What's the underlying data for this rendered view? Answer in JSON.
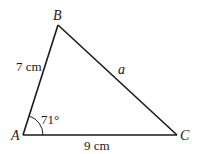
{
  "diagram": {
    "type": "triangle",
    "vertices": [
      {
        "label": "A",
        "x": 23,
        "y": 135
      },
      {
        "label": "B",
        "x": 58,
        "y": 25
      },
      {
        "label": "C",
        "x": 177,
        "y": 135
      }
    ],
    "sides": [
      {
        "from": "A",
        "to": "B",
        "label": "7 cm"
      },
      {
        "from": "A",
        "to": "C",
        "label": "9 cm"
      },
      {
        "from": "B",
        "to": "C",
        "label": "a"
      }
    ],
    "angles": [
      {
        "at": "A",
        "label": "71°"
      }
    ],
    "stroke_color": "#1a1a1a"
  }
}
